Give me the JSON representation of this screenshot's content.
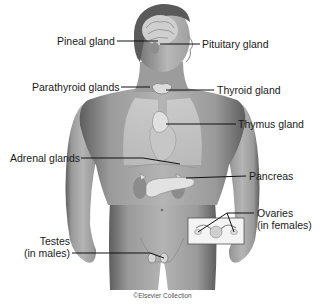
{
  "figure": {
    "credit": "©Elsevier Collection",
    "colors": {
      "skin": "#a8a8a8",
      "skin_shadow": "#6e6e6e",
      "hair": "#5a5a5a",
      "organ": "#d2d2d2",
      "leader_line": "#111111",
      "text": "#1a1a1a"
    },
    "labels": {
      "pineal": "Pineal gland",
      "pituitary": "Pituitary gland",
      "parathyroid": "Parathyroid glands",
      "thyroid": "Thyroid gland",
      "thymus": "Thymus gland",
      "adrenal": "Adrenal glands",
      "pancreas": "Pancreas",
      "ovaries_line1": "Ovaries",
      "ovaries_line2": "(in females)",
      "testes_line1": "Testes",
      "testes_line2": "(in males)"
    }
  }
}
